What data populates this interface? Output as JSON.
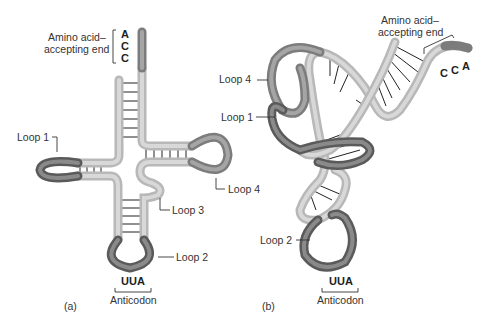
{
  "figure": {
    "panel_a": {
      "id_label": "(a)",
      "amino_label_line1": "Amino acid–",
      "amino_label_line2": "accepting end",
      "bases": [
        "A",
        "C",
        "C"
      ],
      "loops": [
        "Loop 1",
        "Loop 2",
        "Loop 3",
        "Loop 4"
      ],
      "anticodon_seq": "UUA",
      "anticodon_label": "Anticodon"
    },
    "panel_b": {
      "id_label": "(b)",
      "amino_label_line1": "Amino acid–",
      "amino_label_line2": "accepting end",
      "bases": [
        "C",
        "C",
        "A"
      ],
      "loops": [
        "Loop 4",
        "Loop 1",
        "Loop 2"
      ],
      "anticodon_seq": "UUA",
      "anticodon_label": "Anticodon"
    }
  }
}
